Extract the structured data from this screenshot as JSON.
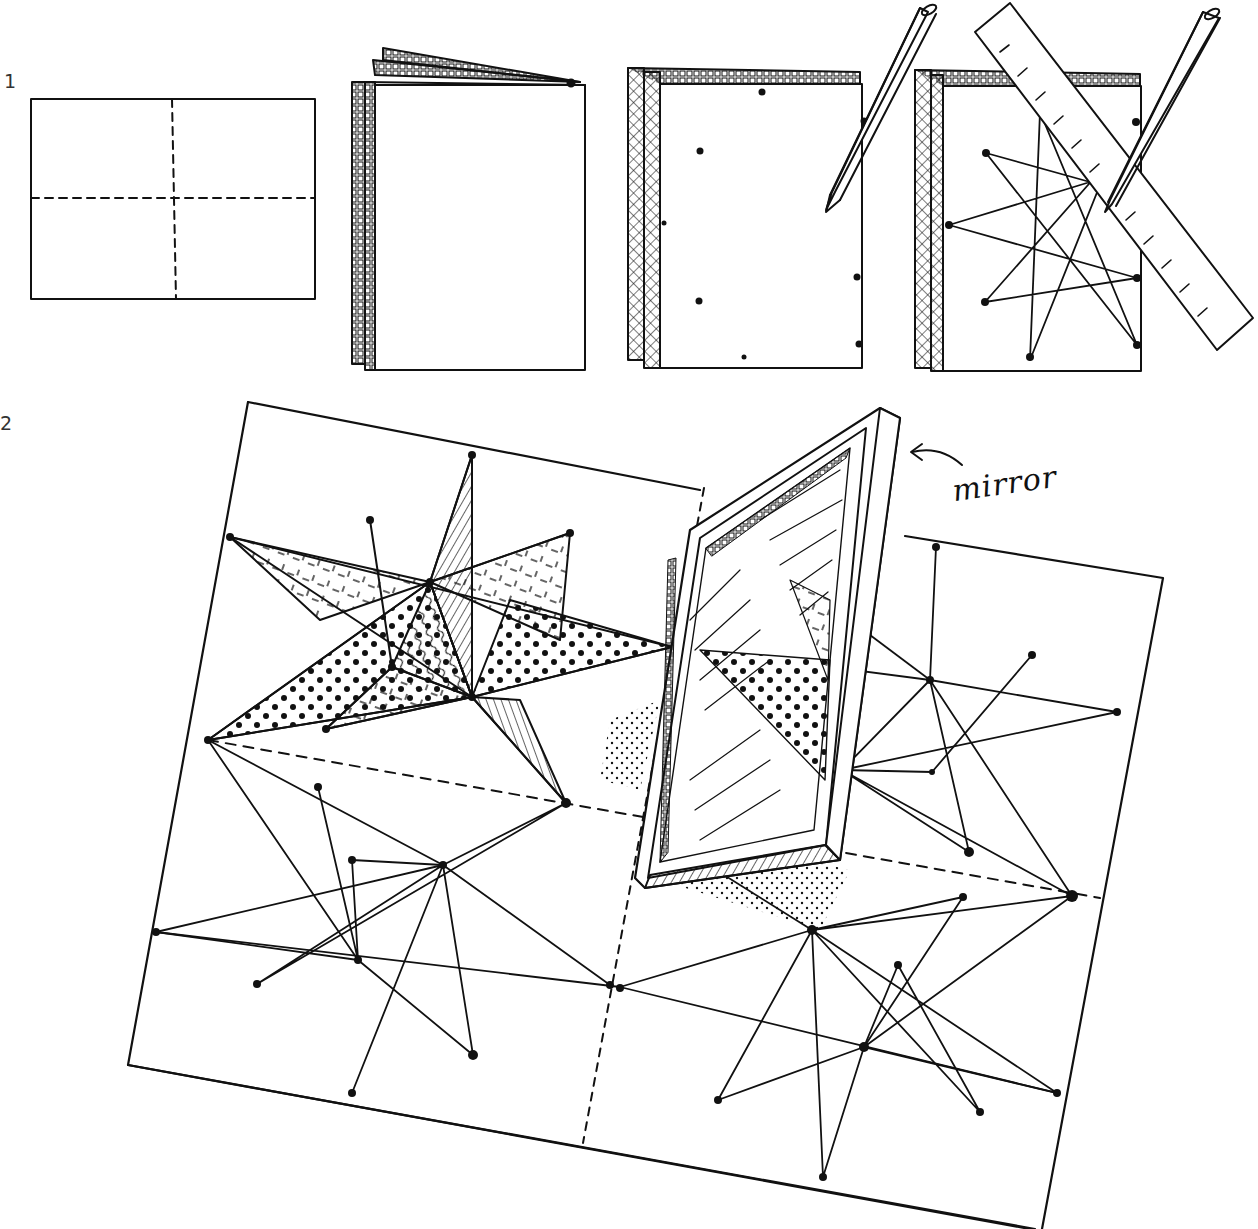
{
  "diagram": {
    "ink_color": "#111111",
    "background": "#ffffff",
    "steps": [
      {
        "label": "1",
        "panels": [
          {
            "name": "flat-sheet-with-fold-lines",
            "description": "rectangle with dashed horizontal and vertical fold lines"
          },
          {
            "name": "folded-booklet",
            "description": "sheet folded into a booklet, textured edges"
          },
          {
            "name": "booklet-marked-with-dots",
            "description": "booklet with dots marked, pencil"
          },
          {
            "name": "booklet-with-star-lines",
            "description": "dots connected with straight lines using ruler and pencil"
          }
        ]
      },
      {
        "label": "2",
        "panels": [
          {
            "name": "unfolded-sheet-with-stars-and-mirror",
            "description": "unfolded sheet showing four mirrored star patterns, one shaded, with a standing mirror"
          }
        ]
      }
    ],
    "annotations": [
      {
        "text": "mirror",
        "points_to": "mirror"
      }
    ]
  },
  "labels": {
    "step1": "1",
    "step2": "2",
    "mirror": "mirror"
  },
  "geometry": {
    "flat_sheet": {
      "x": 31,
      "y": 99,
      "w": 284,
      "h": 200,
      "fold_x": 174,
      "fold_y": 198
    },
    "booklet": {
      "x": 365,
      "y": 85,
      "w": 220,
      "h": 285
    },
    "marked_booklet": {
      "x": 655,
      "y": 85,
      "w": 210,
      "h": 285
    },
    "star_booklet": {
      "x": 940,
      "y": 85,
      "w": 200,
      "h": 285
    },
    "big_sheet_corners": [
      [
        248,
        402
      ],
      [
        1163,
        578
      ],
      [
        1042,
        1229
      ],
      [
        128,
        1065
      ]
    ]
  }
}
